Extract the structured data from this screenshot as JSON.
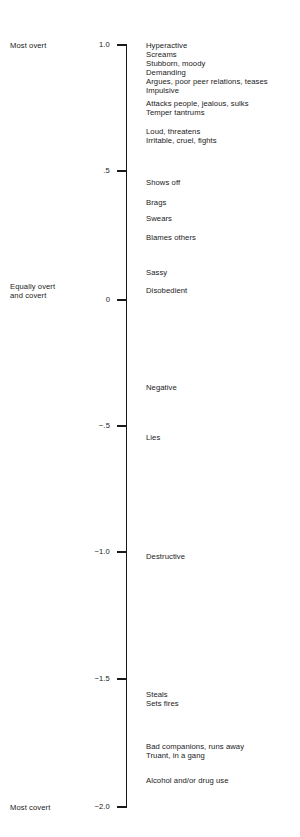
{
  "figure": {
    "axis_color": "#1a1a1a",
    "background": "#ffffff"
  },
  "anchors": {
    "top": "Most overt",
    "middle_line1": "Equally overt",
    "middle_line2": "and covert",
    "bottom": "Most covert"
  },
  "ticks": [
    {
      "label": "1.0",
      "value": 1.0
    },
    {
      "label": ".5",
      "value": 0.5
    },
    {
      "label": "0",
      "value": 0.0
    },
    {
      "label": "−.5",
      "value": -0.5
    },
    {
      "label": "−1.0",
      "value": -1.0
    },
    {
      "label": "−1.5",
      "value": -1.5
    },
    {
      "label": "−2.0",
      "value": -2.0
    }
  ],
  "items": [
    {
      "label": "Hyperactive",
      "value": 0.98
    },
    {
      "label": "Screams",
      "value": 0.94
    },
    {
      "label": "Stubborn, moody",
      "value": 0.91
    },
    {
      "label": "Demanding",
      "value": 0.87
    },
    {
      "label": "Argues, poor peer relations, teases",
      "value": 0.84
    },
    {
      "label": "Impulsive",
      "value": 0.8
    },
    {
      "label": "Attacks people, jealous, sulks",
      "value": 0.77
    },
    {
      "label": "Temper tantrums",
      "value": 0.73
    },
    {
      "label": "Loud, threatens",
      "value": 0.66
    },
    {
      "label": "Irritable, cruel, fights",
      "value": 0.62
    },
    {
      "label": "Shows off",
      "value": 0.46
    },
    {
      "label": "Brags",
      "value": 0.38
    },
    {
      "label": "Swears",
      "value": 0.32
    },
    {
      "label": "Blames others",
      "value": 0.25
    },
    {
      "label": "Sassy",
      "value": 0.11
    },
    {
      "label": "Disobedient",
      "value": 0.04
    },
    {
      "label": "Negative",
      "value": -0.34
    },
    {
      "label": "Lies",
      "value": -0.54
    },
    {
      "label": "Destructive",
      "value": -0.99
    },
    {
      "label": "Steals",
      "value": -1.56
    },
    {
      "label": "Sets fires",
      "value": -1.6
    },
    {
      "label": "Bad companions, runs away",
      "value": -1.77
    },
    {
      "label": "Truant, in a gang",
      "value": -1.8
    },
    {
      "label": "Alcohol and/or drug use",
      "value": -1.9
    }
  ],
  "chart_data": {
    "type": "scatter",
    "title": "",
    "xlabel": "",
    "ylabel": "Overt – Covert dimension score",
    "ylim": [
      -2.0,
      1.0
    ],
    "yticks": [
      1.0,
      0.5,
      0.0,
      -0.5,
      -1.0,
      -1.5,
      -2.0
    ],
    "ytick_labels": [
      "1.0",
      ".5",
      "0",
      "−.5",
      "−1.0",
      "−1.5",
      "−2.0"
    ],
    "grid": false,
    "legend": "none",
    "axis_anchor_labels": {
      "1.0": "Most overt",
      "0": "Equally overt and covert",
      "-2.0": "Most covert"
    },
    "categories": [
      "Hyperactive",
      "Screams",
      "Stubborn, moody",
      "Demanding",
      "Argues, poor peer relations, teases",
      "Impulsive",
      "Attacks people, jealous, sulks",
      "Temper tantrums",
      "Loud, threatens",
      "Irritable, cruel, fights",
      "Shows off",
      "Brags",
      "Swears",
      "Blames others",
      "Sassy",
      "Disobedient",
      "Negative",
      "Lies",
      "Destructive",
      "Steals",
      "Sets fires",
      "Bad companions, runs away",
      "Truant, in a gang",
      "Alcohol and/or drug use"
    ],
    "values": [
      0.98,
      0.94,
      0.91,
      0.87,
      0.84,
      0.8,
      0.77,
      0.73,
      0.66,
      0.62,
      0.46,
      0.38,
      0.32,
      0.25,
      0.11,
      0.04,
      -0.34,
      -0.54,
      -0.99,
      -1.56,
      -1.6,
      -1.77,
      -1.8,
      -1.9
    ]
  },
  "layout": {
    "axis_top_px": 45,
    "axis_bottom_px": 807,
    "tick_px": [
      45,
      171,
      300,
      426,
      552,
      679,
      807
    ],
    "item_px": [
      45,
      54,
      63,
      72,
      81,
      90,
      103,
      112,
      131,
      140,
      182,
      202,
      218,
      237,
      272,
      290,
      387,
      437,
      556,
      694,
      703,
      746,
      755,
      780
    ]
  }
}
